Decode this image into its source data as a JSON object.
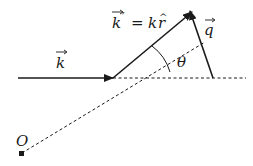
{
  "diagram": {
    "title": "",
    "labels": {
      "k": "k",
      "k_prime_lhs": "k",
      "prime": "′",
      "equals": "=",
      "k_hat_k": "k",
      "r": "r",
      "hat": "^",
      "q": "q",
      "theta": "θ",
      "origin": "O"
    },
    "colors": {
      "line": "#1a1a1a",
      "background": "#ffffff"
    },
    "elements": [
      {
        "name": "incident-wave-vector",
        "type": "arrow",
        "label": "k⃗",
        "from": [
          18,
          78
        ],
        "to": [
          113,
          78
        ],
        "style": "solid"
      },
      {
        "name": "scattered-wave-vector",
        "type": "arrow",
        "label": "k⃗′ = k r̂",
        "from": [
          113,
          78
        ],
        "to": [
          192,
          12
        ],
        "style": "solid"
      },
      {
        "name": "momentum-transfer-vector",
        "type": "arrow",
        "label": "q⃗",
        "from": [
          213,
          78
        ],
        "to": [
          190,
          11
        ],
        "style": "solid"
      },
      {
        "name": "forward-direction-line",
        "type": "line",
        "from": [
          113,
          78
        ],
        "to": [
          245,
          78
        ],
        "style": "dashed"
      },
      {
        "name": "observer-direction-line",
        "type": "line",
        "from": [
          22,
          153
        ],
        "to": [
          205,
          42
        ],
        "style": "dashed"
      },
      {
        "name": "scattering-angle-arc",
        "type": "arc",
        "label": "θ",
        "center": [
          113,
          78
        ]
      },
      {
        "name": "origin-point",
        "type": "point",
        "label": "O",
        "at": [
          22,
          154
        ]
      }
    ]
  }
}
